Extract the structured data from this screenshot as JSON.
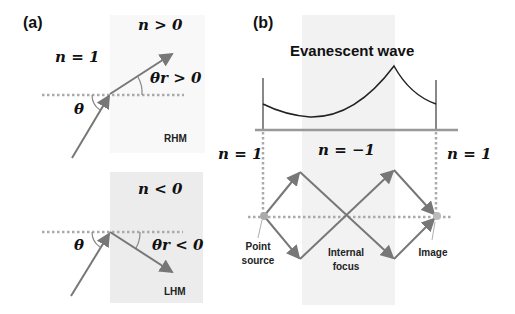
{
  "panel_a": {
    "label": "(a)",
    "top": {
      "medium_left": "n = 1",
      "medium_right": "n > 0",
      "incident_angle": "θ",
      "refracted_angle": "θr > 0",
      "material": "RHM"
    },
    "bottom": {
      "medium_right": "n < 0",
      "incident_angle": "θ",
      "refracted_angle": "θr < 0",
      "material": "LHM"
    }
  },
  "panel_b": {
    "label": "(b)",
    "title": "Evanescent wave",
    "regions": [
      "n = 1",
      "n = −1",
      "n = 1"
    ],
    "annotations": {
      "source": [
        "Point",
        "source"
      ],
      "focus": [
        "Internal",
        "focus"
      ],
      "image": "Image"
    }
  },
  "colors": {
    "ray": "#777777",
    "interface": "#a8a8a8",
    "slab": "#f0f0f0",
    "curve": "#222222"
  }
}
